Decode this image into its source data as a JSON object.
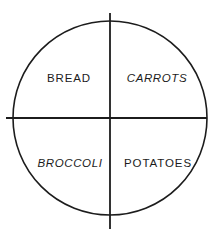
{
  "diagram": {
    "type": "plate-quadrant-diagram",
    "title": "",
    "shape": "circle",
    "divider_style": "cross",
    "stroke_color": "#1c1c1c",
    "fill_color": "#ffffff",
    "background_color": "#ffffff",
    "circle": {
      "center_x": 110,
      "center_y": 118,
      "radius": 97,
      "stroke_width": 1.6
    },
    "dividers": [
      {
        "name": "vertical-divider",
        "orientation": "vertical",
        "x1": 110,
        "y1": 13,
        "x2": 110,
        "y2": 229,
        "stroke_width": 1.8
      },
      {
        "name": "horizontal-divider",
        "orientation": "horizontal",
        "x1": 6,
        "y1": 118,
        "x2": 207,
        "y2": 118,
        "stroke_width": 1.8
      }
    ],
    "quadrants": [
      {
        "position": "top-left",
        "label": "BREAD",
        "style": "upright"
      },
      {
        "position": "top-right",
        "label": "CARROTS",
        "style": "slanted"
      },
      {
        "position": "bottom-left",
        "label": "BROCCOLI",
        "style": "slanted"
      },
      {
        "position": "bottom-right",
        "label": "POTATOES",
        "style": "upright"
      }
    ]
  }
}
